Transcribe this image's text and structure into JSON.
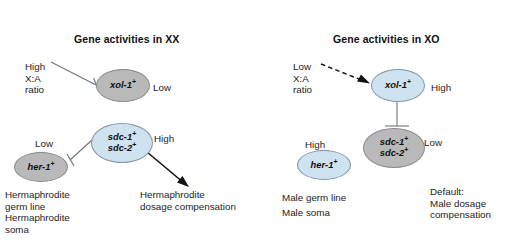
{
  "figure": {
    "background_color": "#ffffff",
    "node_high_color": "#cfe2ef",
    "node_low_color": "#b9b9b9",
    "connector_color": "#5f6b75",
    "arrow_color": "#111111"
  },
  "panels": {
    "xx": {
      "title": "Gene activities in XX",
      "ratio_label": "High\nX:A\nratio",
      "nodes": {
        "xol1": {
          "gene": "xol-1",
          "superscript": "+",
          "level": "Low",
          "state": "low"
        },
        "sdc": {
          "gene_1": "sdc-1",
          "gene_2": "sdc-2",
          "superscript": "+",
          "level": "High",
          "state": "high"
        },
        "her1": {
          "gene": "her-1",
          "superscript": "+",
          "level": "Low",
          "state": "low"
        }
      },
      "outcomes": {
        "germ_line": "Hermaphrodite\ngerm line",
        "soma": "Hermaphrodite\nsoma",
        "dosage": "Hermaphrodite\ndosage compensation"
      }
    },
    "xo": {
      "title": "Gene activities in XO",
      "ratio_label": "Low\nX:A\nratio",
      "nodes": {
        "xol1": {
          "gene": "xol-1",
          "superscript": "+",
          "level": "High",
          "state": "high"
        },
        "sdc": {
          "gene_1": "sdc-1",
          "gene_2": "sdc-2",
          "superscript": "+",
          "level": "Low",
          "state": "low"
        },
        "her1": {
          "gene": "her-1",
          "superscript": "+",
          "level": "High",
          "state": "high"
        }
      },
      "outcomes": {
        "germ_line": "Male germ line",
        "soma": "Male soma",
        "dosage": "Default:\nMale dosage\ncompensation"
      }
    }
  }
}
